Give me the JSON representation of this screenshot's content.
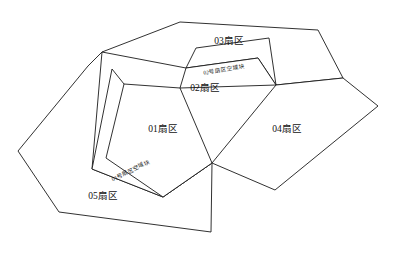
{
  "diagram": {
    "type": "sector-airspace-partition-diagram",
    "background_color": "#ffffff",
    "line_color": "#1a1a1a",
    "text_color": "#111111",
    "regions": [
      {
        "id": "sector-01",
        "label": "01扇区",
        "label_x": 163,
        "label_y": 130,
        "points": "124,84 180,88 212,163 163,197 106,158"
      },
      {
        "id": "sector-02",
        "label": "02扇区",
        "label_x": 205,
        "label_y": 89,
        "points": "180,88 186,68 258,58 276,85"
      },
      {
        "id": "sector-03",
        "label": "03扇区",
        "label_x": 229,
        "label_y": 42,
        "points": "102,52 180,22 318,30 343,78 276,85 258,58 186,68"
      },
      {
        "id": "sector-04",
        "label": "04扇区",
        "label_x": 287,
        "label_y": 130,
        "points": "276,85 343,78 378,106 275,190 212,163"
      },
      {
        "id": "sector-05",
        "label": "05扇区",
        "label_x": 103,
        "label_y": 197,
        "points": "102,52 88,66 18,151 59,212 211,232 212,163 163,197 92,169"
      }
    ],
    "bands": [
      {
        "id": "band-01",
        "label": "01号扇区空域块",
        "label_x": 131,
        "label_y": 171,
        "label_rotation": -26,
        "points": "112,69 92,169 163,197 212,163 124,84"
      },
      {
        "id": "band-02",
        "label": "02号扇区空域块",
        "label_x": 224,
        "label_y": 70,
        "label_rotation": -10,
        "points": "186,68 196,48 269,38 276,85 258,58"
      }
    ]
  }
}
